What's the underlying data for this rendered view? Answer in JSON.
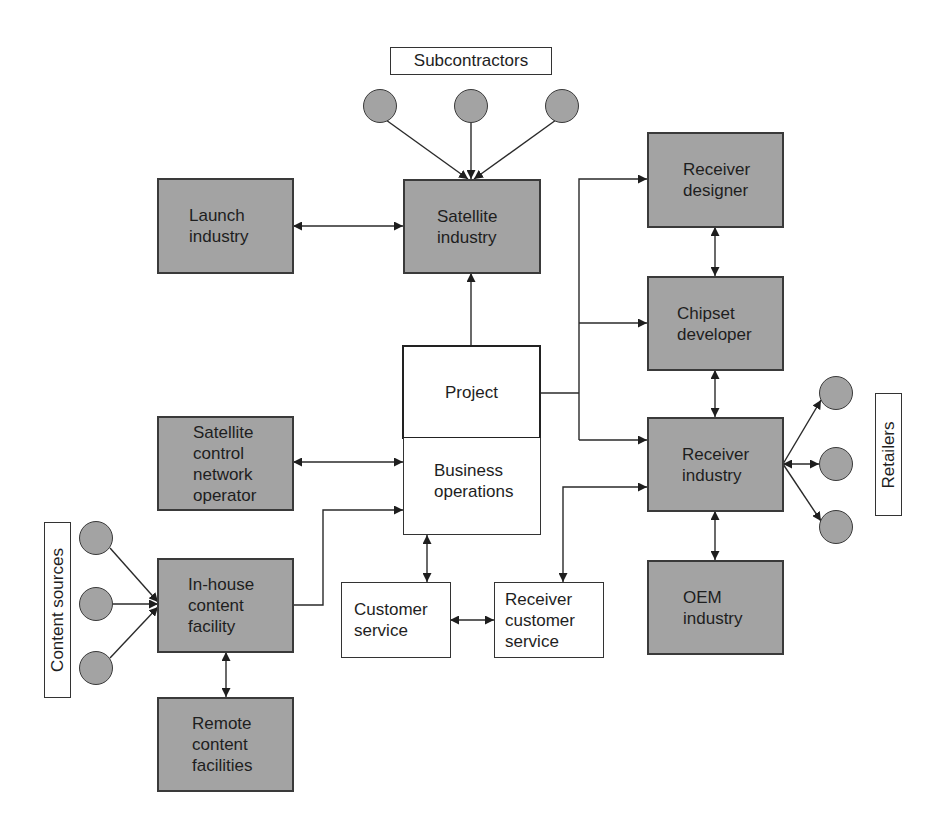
{
  "labels": {
    "subcontractors": "Subcontractors",
    "content_sources": "Content sources",
    "retailers": "Retailers"
  },
  "nodes": {
    "launch_industry": [
      "Launch",
      "industry"
    ],
    "satellite_industry": [
      "Satellite",
      "industry"
    ],
    "receiver_designer": [
      "Receiver",
      "designer"
    ],
    "chipset_developer": [
      "Chipset",
      "developer"
    ],
    "project": [
      "Project"
    ],
    "business_operations": [
      "Business",
      "operations"
    ],
    "satellite_control": [
      "Satellite",
      "control",
      "network",
      "operator"
    ],
    "receiver_industry": [
      "Receiver",
      "industry"
    ],
    "in_house_content": [
      "In-house",
      "content",
      "facility"
    ],
    "customer_service": [
      "Customer",
      "service"
    ],
    "receiver_customer_service": [
      "Receiver",
      "customer",
      "service"
    ],
    "oem_industry": [
      "OEM",
      "industry"
    ],
    "remote_content": [
      "Remote",
      "content",
      "facilities"
    ]
  },
  "colors": {
    "box_fill": "#a3a3a3",
    "box_border": "#3a3a3a",
    "line": "#222222"
  }
}
